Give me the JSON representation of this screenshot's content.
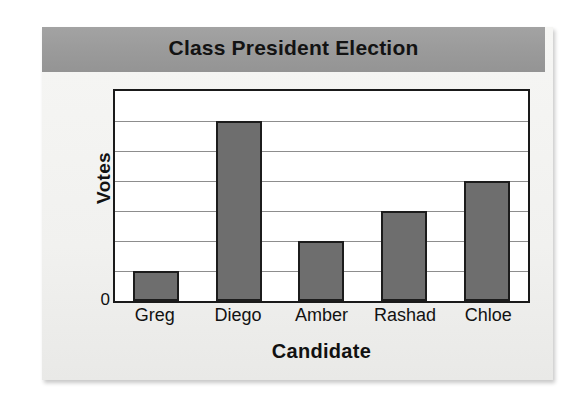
{
  "figure": {
    "title": "Class President Election",
    "y_zero_tick": "0",
    "y_axis_label": "Votes",
    "x_axis_label": "Candidate"
  },
  "colors": {
    "banner": "#9b9b9b",
    "bar_fill": "#6e6e6e",
    "bar_stroke": "#1c1c1c",
    "plot_border": "#1a1a1a",
    "gridline": "#8d8d8d",
    "card_background": "#f3f3f1",
    "text": "#121212"
  },
  "chart_data": {
    "type": "bar",
    "title": "Class President Election",
    "xlabel": "Candidate",
    "ylabel": "Votes",
    "categories": [
      "Greg",
      "Diego",
      "Amber",
      "Rashad",
      "Chloe"
    ],
    "values": [
      1,
      6,
      2,
      3,
      4
    ],
    "ylim": [
      0,
      7
    ],
    "y_tick_labels": [
      "0"
    ],
    "gridlines": 7,
    "grid": true,
    "legend": false,
    "orientation": "vertical"
  }
}
